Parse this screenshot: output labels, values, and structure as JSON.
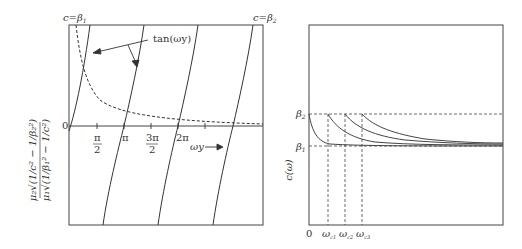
{
  "left_plot": {
    "top_left_label": "c=β",
    "top_left_sub": "1",
    "top_right_label": "c=β",
    "top_right_sub": "2",
    "curve_label": "tan(ωy)",
    "origin_label": "0",
    "x_ticks": [
      {
        "num": "π",
        "den": "2"
      },
      {
        "num": "π",
        "den": ""
      },
      {
        "num": "3π",
        "den": "2"
      },
      {
        "num": "2π",
        "den": ""
      }
    ],
    "x_axis_label": "ωy",
    "y_axis_label_numerator": "μ₂√(1/c² − 1/β₂²)",
    "y_axis_label_denominator": "μ₁√(1/β₁² − 1/c²)"
  },
  "right_plot": {
    "y_axis_label": "c(ω)",
    "y_ticks": [
      {
        "label": "β",
        "sub": "2"
      },
      {
        "label": "β",
        "sub": "1"
      }
    ],
    "x_ticks": [
      {
        "label": "0",
        "sub": ""
      },
      {
        "label": "ω",
        "sub": "c1"
      },
      {
        "label": "ω",
        "sub": "c2"
      },
      {
        "label": "ω",
        "sub": "c3"
      }
    ]
  }
}
